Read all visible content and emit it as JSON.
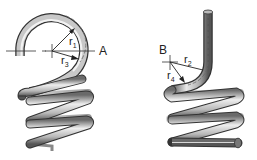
{
  "diagram": {
    "left_spring": {
      "point_label": "A",
      "radii": [
        {
          "name": "r",
          "sub": "1"
        },
        {
          "name": "r",
          "sub": "3"
        }
      ]
    },
    "right_spring": {
      "point_label": "B",
      "radii": [
        {
          "name": "r",
          "sub": "2"
        },
        {
          "name": "r",
          "sub": "4"
        }
      ]
    },
    "colors": {
      "wire_light": "#e8e8e8",
      "wire_mid": "#b0b0b0",
      "wire_dark": "#5a5a5a",
      "line": "#222222"
    }
  }
}
